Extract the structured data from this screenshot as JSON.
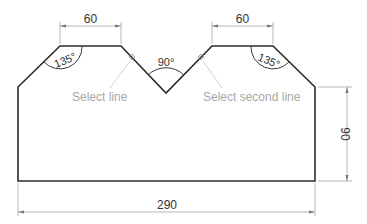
{
  "drawing": {
    "dimensions": {
      "top_left_width": "60",
      "top_right_width": "60",
      "overall_width": "290",
      "right_height": "90"
    },
    "angles": {
      "left": "135°",
      "center": "90°",
      "right": "135°"
    },
    "prompts": {
      "first": "Select line",
      "second": "Select second line"
    },
    "colors": {
      "outline": "#2b2b2b",
      "dimension_line": "#9a9a9a",
      "prompt_text": "#a8a8a8"
    }
  }
}
